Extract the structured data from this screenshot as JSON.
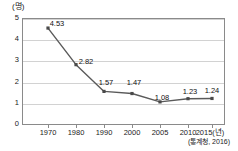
{
  "unit_label": "(명)",
  "source_note": "(통계청, 2016)",
  "axis": {
    "y_ticks": [
      "0",
      "1",
      "2",
      "3",
      "4",
      "5"
    ],
    "x_ticks": [
      "1970",
      "1980",
      "1990",
      "2000",
      "2005",
      "2010",
      "2015(년)"
    ]
  },
  "colors": {
    "line": "#5a5a5a",
    "marker": "#4a4a4a",
    "grid": "#d2d2d2",
    "frame": "#8a8a8a",
    "text": "#111111"
  },
  "chart_data": {
    "type": "line",
    "title": "",
    "subtitle": "",
    "xlabel": "년",
    "ylabel": "명",
    "unit": "명",
    "source": "통계청, 2016",
    "categories": [
      "1970",
      "1980",
      "1990",
      "2000",
      "2005",
      "2010",
      "2015"
    ],
    "x_tick_labels": [
      "1970",
      "1980",
      "1990",
      "2000",
      "2005",
      "2010",
      "2015(년)"
    ],
    "values": [
      4.53,
      2.82,
      1.57,
      1.47,
      1.08,
      1.23,
      1.24
    ],
    "point_labels": [
      "4.53",
      "2.82",
      "1.57",
      "1.47",
      "1.08",
      "1.23",
      "1.24"
    ],
    "ylim": [
      0,
      5
    ],
    "y_ticks": [
      0,
      1,
      2,
      3,
      4,
      5
    ],
    "grid": "horizontal",
    "legend": "none",
    "marker": "square"
  }
}
